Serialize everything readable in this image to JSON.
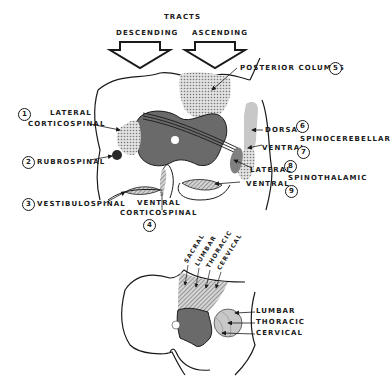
{
  "header": {
    "title": "TRACTS",
    "descending": "DESCENDING",
    "ascending": "ASCENDING"
  },
  "upper_section": {
    "tracts": [
      {
        "number": "1",
        "label_line1": "LATERAL",
        "label_line2": "CORTICOSPINAL",
        "group": "descending"
      },
      {
        "number": "2",
        "label_line1": "RUBROSPINAL",
        "group": "descending"
      },
      {
        "number": "3",
        "label_line1": "VESTIBULOSPINAL",
        "group": "descending"
      },
      {
        "number": "4",
        "label_line1": "VENTRAL",
        "label_line2": "CORTICOSPINAL",
        "group": "descending"
      },
      {
        "number": "5",
        "label_line1": "POSTERIOR COLUMNS",
        "group": "ascending"
      },
      {
        "number": "6",
        "label_line1": "DORSAL",
        "group": "ascending"
      },
      {
        "number": "7",
        "label_line1": "VENTRAL",
        "group": "ascending"
      },
      {
        "number": "8",
        "label_line1": "LATERAL",
        "group": "ascending"
      },
      {
        "number": "9",
        "label_line1": "VENTRAL",
        "group": "ascending"
      }
    ],
    "spinocerebellar": "SPINOCEREBELLAR",
    "spinothalamic": "SPINOTHALAMIC"
  },
  "lower_section": {
    "posterior_column_layers": [
      "SACRAL",
      "LUMBAR",
      "THORACIC",
      "CERVICAL"
    ],
    "lateral_tract_layers": [
      "LUMBAR",
      "THORACIC",
      "CERVICAL"
    ]
  },
  "colors": {
    "gray_matter": "#6a6a6a",
    "stipple_light": "#c8c8c8",
    "stipple_mid": "#a8a8a8",
    "outline": "#1a1a1a",
    "background": "#ffffff"
  }
}
